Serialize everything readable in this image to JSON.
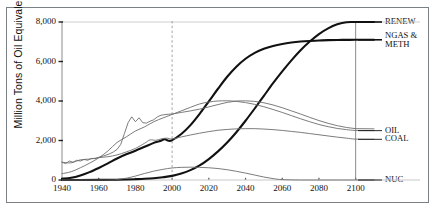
{
  "chart_data": {
    "type": "line",
    "title": "",
    "xlabel": "",
    "ylabel": "Million Tons of Oil Equivalent",
    "xlim": [
      1940,
      2110
    ],
    "ylim": [
      0,
      8000
    ],
    "xticks": [
      1940,
      1960,
      1980,
      2000,
      2020,
      2040,
      2060,
      2080,
      2100
    ],
    "xtick_labels": [
      "1940",
      "1960",
      "1980",
      "2000",
      "2020",
      "2040",
      "2060",
      "2080",
      "2100"
    ],
    "yticks": [
      0,
      2000,
      4000,
      6000,
      8000
    ],
    "ytick_labels": [
      "0",
      "2,000",
      "4,000",
      "6,000",
      "8,000"
    ],
    "grid": false,
    "legend_position": "right-inline-labels",
    "annotations": [
      {
        "name": "present-day-divider",
        "type": "vline",
        "x": 2000,
        "style": "dashed",
        "color": "#9a9a9a"
      },
      {
        "name": "horizon-marker",
        "type": "vline",
        "x": 2100,
        "style": "solid",
        "color": "#7b7f86"
      }
    ],
    "series": [
      {
        "name": "RENEW",
        "label": "RENEW",
        "style": "bold",
        "color": "#111111",
        "width": 2.1,
        "x": [
          1940,
          1950,
          1960,
          1970,
          1975,
          1980,
          1985,
          1990,
          1995,
          2000,
          2005,
          2010,
          2015,
          2020,
          2025,
          2030,
          2035,
          2040,
          2045,
          2050,
          2055,
          2060,
          2065,
          2070,
          2075,
          2080,
          2085,
          2090,
          2095,
          2100,
          2110
        ],
        "values": [
          0,
          0,
          5,
          15,
          25,
          40,
          60,
          90,
          140,
          210,
          330,
          500,
          740,
          1060,
          1450,
          1900,
          2420,
          3000,
          3620,
          4260,
          4900,
          5500,
          6060,
          6570,
          7010,
          7390,
          7680,
          7880,
          7990,
          8000,
          8000
        ]
      },
      {
        "name": "NGAS & METH",
        "label": "NGAS &\nMETH",
        "style": "bold",
        "color": "#111111",
        "width": 2.1,
        "x": [
          1940,
          1945,
          1950,
          1955,
          1960,
          1965,
          1970,
          1975,
          1980,
          1985,
          1990,
          1993,
          1996,
          1998,
          2000,
          2005,
          2010,
          2015,
          2020,
          2025,
          2030,
          2035,
          2040,
          2045,
          2050,
          2055,
          2060,
          2065,
          2070,
          2075,
          2080,
          2085,
          2090,
          2095,
          2100,
          2110
        ],
        "values": [
          60,
          110,
          230,
          400,
          610,
          840,
          1090,
          1300,
          1480,
          1680,
          1880,
          1960,
          2060,
          1990,
          2020,
          2330,
          2780,
          3350,
          3980,
          4620,
          5230,
          5740,
          6140,
          6440,
          6650,
          6790,
          6890,
          6960,
          7010,
          7040,
          7060,
          7080,
          7090,
          7095,
          7100,
          7100
        ]
      },
      {
        "name": "OIL",
        "label": "OIL",
        "style": "thin",
        "color": "#6d6d6d",
        "width": 0.9,
        "x": [
          1940,
          1945,
          1950,
          1955,
          1960,
          1965,
          1970,
          1975,
          1980,
          1985,
          1990,
          1995,
          2000,
          2005,
          2010,
          2015,
          2020,
          2025,
          2030,
          2035,
          2040,
          2045,
          2050,
          2055,
          2060,
          2065,
          2070,
          2075,
          2080,
          2085,
          2090,
          2095,
          2100,
          2110
        ],
        "values": [
          320,
          420,
          620,
          850,
          1120,
          1470,
          1900,
          2180,
          2480,
          2690,
          2950,
          3140,
          3320,
          3500,
          3680,
          3850,
          3950,
          4000,
          4010,
          3980,
          3920,
          3830,
          3710,
          3570,
          3420,
          3260,
          3100,
          2950,
          2810,
          2700,
          2610,
          2550,
          2510,
          2500
        ]
      },
      {
        "name": "COAL",
        "label": "COAL",
        "style": "thin-jagged",
        "color": "#6d6d6d",
        "width": 0.9,
        "x": [
          1940,
          1942,
          1944,
          1946,
          1948,
          1950,
          1952,
          1954,
          1956,
          1958,
          1960,
          1962,
          1964,
          1966,
          1968,
          1970,
          1972,
          1974,
          1976,
          1978,
          1980,
          1982,
          1984,
          1986,
          1988,
          1990,
          1992,
          1994,
          1996,
          1998,
          2000,
          2005,
          2010,
          2015,
          2020,
          2025,
          2030,
          2035,
          2040,
          2045,
          2050,
          2055,
          2060,
          2065,
          2070,
          2075,
          2080,
          2085,
          2090,
          2095,
          2100,
          2110
        ],
        "values": [
          900,
          830,
          960,
          900,
          1000,
          960,
          1040,
          1000,
          1090,
          1080,
          1150,
          1200,
          1260,
          1330,
          1420,
          1550,
          1800,
          2350,
          2900,
          3200,
          2950,
          3150,
          2900,
          2880,
          2980,
          3050,
          3200,
          3280,
          3310,
          3330,
          3340,
          3420,
          3500,
          3590,
          3700,
          3820,
          3930,
          4000,
          4010,
          3980,
          3910,
          3800,
          3660,
          3500,
          3340,
          3170,
          3010,
          2870,
          2750,
          2660,
          2600,
          2590
        ]
      },
      {
        "name": "NUC",
        "label": "NUC",
        "style": "thin",
        "color": "#6d6d6d",
        "width": 0.9,
        "x": [
          1940,
          1965,
          1970,
          1975,
          1980,
          1985,
          1990,
          1995,
          2000,
          2005,
          2010,
          2015,
          2020,
          2025,
          2030,
          2035,
          2040,
          2045,
          2050,
          2055,
          2060,
          2070,
          2080,
          2090,
          2100,
          2110
        ],
        "values": [
          0,
          0,
          30,
          90,
          200,
          330,
          450,
          540,
          610,
          640,
          650,
          640,
          620,
          580,
          520,
          440,
          350,
          250,
          150,
          70,
          20,
          0,
          0,
          0,
          0,
          0
        ]
      },
      {
        "name": "COAL-lower-branch",
        "label": "",
        "style": "thin",
        "color": "#6d6d6d",
        "width": 0.9,
        "x": [
          1940,
          1945,
          1950,
          1955,
          1960,
          1965,
          1970,
          1975,
          1980,
          1985,
          1988,
          1991,
          1994,
          1997,
          2000,
          2005,
          2010,
          2015,
          2020,
          2025,
          2030,
          2035,
          2040,
          2045,
          2050,
          2055,
          2060,
          2065,
          2070,
          2075,
          2080,
          2085,
          2090,
          2095,
          2100,
          2110
        ],
        "values": [
          900,
          870,
          1020,
          1060,
          1130,
          1180,
          1270,
          1420,
          1600,
          1860,
          2030,
          2010,
          2080,
          2120,
          2080,
          2180,
          2280,
          2370,
          2450,
          2520,
          2560,
          2590,
          2600,
          2600,
          2580,
          2550,
          2510,
          2460,
          2410,
          2350,
          2290,
          2230,
          2170,
          2120,
          2070,
          2060
        ]
      }
    ]
  },
  "axis": {
    "ylabel": "Million Tons of Oil Equivalent"
  }
}
